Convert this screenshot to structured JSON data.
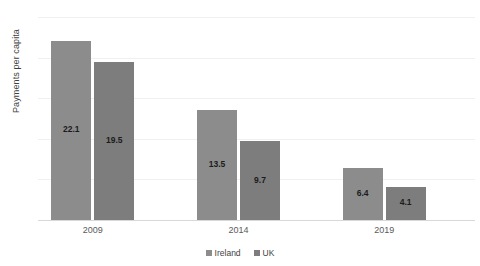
{
  "chart_data": {
    "type": "bar",
    "title": "",
    "xlabel": "",
    "ylabel": "Payments per capita",
    "categories": [
      "2009",
      "2014",
      "2019"
    ],
    "series": [
      {
        "name": "Ireland",
        "values": [
          22.1,
          13.5,
          6.4
        ],
        "color": "#8c8c8c"
      },
      {
        "name": "UK",
        "values": [
          19.5,
          9.7,
          4.1
        ],
        "color": "#7d7d7d"
      }
    ],
    "ylim": [
      0,
      25
    ],
    "yticks": [
      0,
      5,
      10,
      15,
      20,
      25
    ],
    "ytick_labels": [
      "0",
      "5",
      "10",
      "15",
      "20",
      "25"
    ],
    "grid": true,
    "legend_position": "bottom",
    "data_labels": [
      [
        "22.1",
        "13.5",
        "6.4"
      ],
      [
        "19.5",
        "9.7",
        "4.1"
      ]
    ]
  },
  "legend": {
    "items": [
      {
        "label": "Ireland"
      },
      {
        "label": "UK"
      }
    ]
  }
}
